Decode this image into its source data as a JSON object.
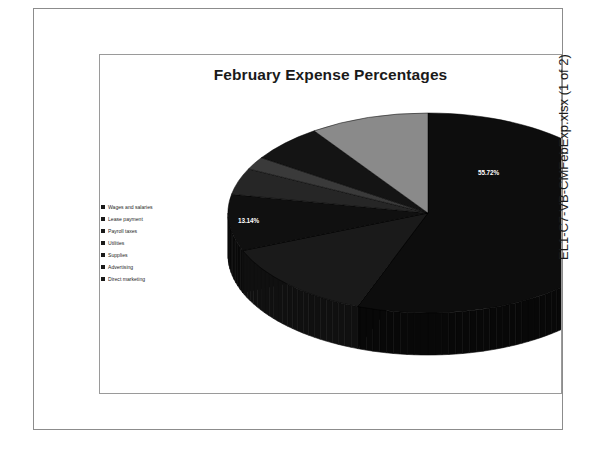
{
  "document": {
    "caption": "EL1-C7-VB-CMFebExp.xlsx (1 of 2)"
  },
  "chart": {
    "title": "February Expense Percentages"
  },
  "chart_data": {
    "type": "pie",
    "title": "February Expense Percentages",
    "xlabel": "",
    "ylabel": "",
    "three_d": true,
    "legend_position": "left",
    "grid": false,
    "value_suffix": "%",
    "categories": [
      "Wages and salaries",
      "Lease payment",
      "Payroll taxes",
      "Utilities",
      "Supplies",
      "Advertising",
      "Direct marketing"
    ],
    "values": [
      55.72,
      13.14,
      9.14,
      4.27,
      2.06,
      6.03,
      9.64
    ],
    "labels": [
      "55.72%",
      "13.14%",
      "9.14%",
      "4.27%",
      "2.06%",
      "6.03%",
      "9.64%"
    ],
    "colors": [
      "#0d0d0d",
      "#1a1a1a",
      "#101010",
      "#262626",
      "#3a3a3a",
      "#141414",
      "#8a8a8a"
    ],
    "legend_swatch_colors": [
      "#1a1a1a",
      "#1a1a1a",
      "#1a1a1a",
      "#1a1a1a",
      "#1a1a1a",
      "#1a1a1a",
      "#1a1a1a"
    ],
    "slices": [
      {
        "name": "Wages and salaries",
        "value": 55.72,
        "label": "55.72%",
        "color": "#0d0d0d"
      },
      {
        "name": "Lease payment",
        "value": 13.14,
        "label": "13.14%",
        "color": "#1a1a1a"
      },
      {
        "name": "Payroll taxes",
        "value": 9.14,
        "label": "9.14%",
        "color": "#101010"
      },
      {
        "name": "Utilities",
        "value": 4.27,
        "label": "4.27%",
        "color": "#262626"
      },
      {
        "name": "Supplies",
        "value": 2.06,
        "label": "2.06%",
        "color": "#3a3a3a"
      },
      {
        "name": "Advertising",
        "value": 6.03,
        "label": "6.03%",
        "color": "#141414"
      },
      {
        "name": "Direct marketing",
        "value": 9.64,
        "label": "9.64%",
        "color": "#8a8a8a"
      }
    ],
    "total": 100.0
  }
}
